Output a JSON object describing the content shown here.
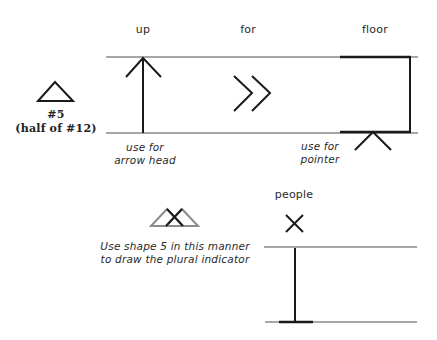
{
  "labels": {
    "up": "up",
    "for": "for",
    "floor": "floor",
    "people": "people"
  },
  "shape5": {
    "number": "#5",
    "note": "(half of #12)"
  },
  "captions": {
    "arrow_head_line1": "use for",
    "arrow_head_line2": "arrow head",
    "pointer_line1": "use for",
    "pointer_line2": "pointer",
    "plural_line1": "Use shape 5 in this manner",
    "plural_line2": "to draw the plural indicator"
  },
  "colors": {
    "ink": "#1a1a1a",
    "staff_line": "#8a8a8a",
    "gray_triangle": "#8c8c8c"
  }
}
